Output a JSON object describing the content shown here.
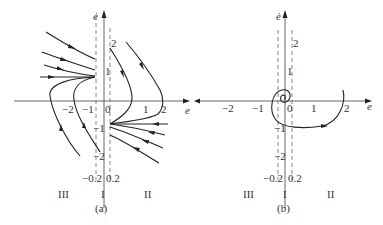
{
  "figure": {
    "top_text_partial": "",
    "panels": [
      {
        "id": "a",
        "caption": "(a)",
        "y_axis_label": "ė",
        "x_axis_label": "e",
        "x_ticks": [
          "−2",
          "−1",
          "0",
          "1",
          "2"
        ],
        "y_ticks": [
          "2",
          "1",
          "−1",
          "−2"
        ],
        "boundary_labels": [
          "−0.2",
          "0.2"
        ],
        "region_labels": [
          "III",
          "I",
          "II"
        ]
      },
      {
        "id": "b",
        "caption": "(b)",
        "y_axis_label": "ė",
        "x_axis_label": "e",
        "x_ticks": [
          "−2",
          "−1",
          "0",
          "1",
          "2"
        ],
        "y_ticks": [
          "2",
          "1",
          "−1",
          "−2"
        ],
        "boundary_labels": [
          "−0.2",
          "0.2"
        ],
        "region_labels": [
          "III",
          "I",
          "II"
        ]
      }
    ]
  }
}
